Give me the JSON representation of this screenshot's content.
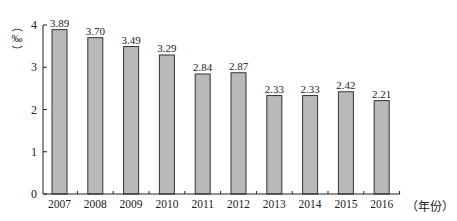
{
  "chart_data": {
    "type": "bar",
    "title": "",
    "xlabel": "（年份）",
    "ylabel": "‰",
    "categories": [
      "2007",
      "2008",
      "2009",
      "2010",
      "2011",
      "2012",
      "2013",
      "2014",
      "2015",
      "2016"
    ],
    "values": [
      3.89,
      3.7,
      3.49,
      3.29,
      2.84,
      2.87,
      2.33,
      2.33,
      2.42,
      2.21
    ],
    "data_labels": [
      "3.89",
      "3.70",
      "3.49",
      "3.29",
      "2.84",
      "2.87",
      "2.33",
      "2.33",
      "2.42",
      "2.21"
    ],
    "yticks": [
      "0",
      "1",
      "2",
      "3",
      "4"
    ],
    "ylim": [
      0,
      4
    ],
    "grid": false,
    "legend": "none",
    "colors": {
      "bar_fill": "#b9b9b9",
      "bar_stroke": "#333333",
      "axis": "#222222"
    }
  },
  "labels": {
    "y_unit_open": "（",
    "y_unit": "‰",
    "y_unit_close": "）",
    "x_unit": "（年份）"
  }
}
